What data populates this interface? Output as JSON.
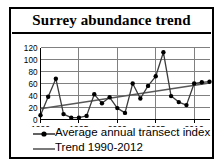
{
  "card": {
    "title": "Surrey abundance trend"
  },
  "legend": {
    "series_label": "Average annual transect index",
    "trend_label": "Trend 1990-2012"
  },
  "colors": {
    "line": "#3b3b3b",
    "marker": "#000000",
    "trend": "#595959",
    "grid": "#808080",
    "axis": "#000000",
    "title": "#000000",
    "border": "#000000",
    "background": "#ffffff"
  },
  "chart_data": {
    "type": "line",
    "title": "Surrey abundance trend",
    "xlabel": "",
    "ylabel": "",
    "xlim": [
      1990,
      2012
    ],
    "ylim": [
      0,
      120
    ],
    "ytick_values": [
      0,
      20,
      40,
      60,
      80,
      100,
      120
    ],
    "ytick_labels": [
      "0",
      "20",
      "40",
      "60",
      "80",
      "100",
      "120"
    ],
    "xtick_values": [
      1990,
      1995,
      2000,
      2005,
      2010
    ],
    "xtick_labels": [
      "1990",
      "1995",
      "2000",
      "2005",
      "2010"
    ],
    "grid": "horizontal-and-major-vertical",
    "legend_position": "below",
    "x": [
      1990,
      1991,
      1992,
      1993,
      1994,
      1995,
      1996,
      1997,
      1998,
      1999,
      2000,
      2001,
      2002,
      2003,
      2004,
      2005,
      2006,
      2007,
      2008,
      2009,
      2010,
      2011,
      2012
    ],
    "series": [
      {
        "name": "Average annual transect index",
        "marker": "filled-circle",
        "values": [
          7,
          38,
          68,
          9,
          3,
          3,
          6,
          42,
          27,
          37,
          19,
          11,
          60,
          35,
          56,
          72,
          112,
          39,
          29,
          24,
          60,
          62,
          63
        ]
      },
      {
        "name": "Trend 1990-2012",
        "marker": "none",
        "values": [
          18,
          20,
          22,
          24,
          26,
          28,
          30,
          31,
          33,
          35,
          37,
          39,
          41,
          43,
          45,
          47,
          49,
          51,
          52,
          54,
          56,
          58,
          61
        ]
      }
    ]
  }
}
